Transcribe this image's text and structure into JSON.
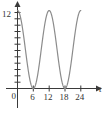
{
  "chart_data": {
    "type": "line",
    "title": "",
    "xlabel": "t",
    "ylabel": "",
    "xlim": [
      0,
      26
    ],
    "ylim": [
      0,
      13
    ],
    "grid": false,
    "legend": null,
    "x_ticks": [
      6,
      12,
      18,
      24
    ],
    "x_tick_labels": [
      "6",
      "12",
      "18",
      "24"
    ],
    "y_ticks": [
      1,
      2,
      3,
      4,
      5,
      6,
      7,
      8,
      9,
      10,
      11,
      12
    ],
    "y_tick_labels_shown": [
      "12"
    ],
    "origin_label": "0",
    "y_label_top": "12",
    "axis_label_x": "t",
    "curve_color": "#8c8c8c",
    "axis_color": "#3a3a3a",
    "text_color": "#333333",
    "series": [
      {
        "name": "curve",
        "formula": "y = 6 + 6*cos(pi*t/6)",
        "amplitude": 6,
        "midline": 6,
        "period": 12,
        "maxima_x": [
          0,
          12,
          24
        ],
        "maxima_y": [
          12,
          12,
          12
        ],
        "minima_x": [
          6,
          18
        ],
        "minima_y": [
          0,
          0
        ],
        "x": [
          0,
          1,
          2,
          3,
          4,
          5,
          6,
          7,
          8,
          9,
          10,
          11,
          12,
          13,
          14,
          15,
          16,
          17,
          18,
          19,
          20,
          21,
          22,
          23,
          24
        ],
        "values": [
          12,
          11.2,
          9.0,
          6.0,
          3.0,
          0.8,
          0,
          0.8,
          3.0,
          6.0,
          9.0,
          11.2,
          12,
          11.2,
          9.0,
          6.0,
          3.0,
          0.8,
          0,
          0.8,
          3.0,
          6.0,
          9.0,
          11.2,
          12
        ]
      }
    ]
  },
  "labels": {
    "y_top": "12",
    "origin": "0",
    "x1": "6",
    "x2": "12",
    "x3": "18",
    "x4": "24",
    "x_axis_name": "t"
  }
}
